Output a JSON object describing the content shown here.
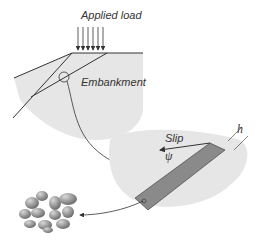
{
  "labels": {
    "applied_load": "Applied load",
    "embankment": "Embankment",
    "slip": "Slip",
    "psi": "ψ",
    "h": "h"
  },
  "colors": {
    "soil_fill": "#e4e4e4",
    "shear_band": "#8a8a8a",
    "line": "#333333",
    "grain": "#9a9a9a"
  }
}
